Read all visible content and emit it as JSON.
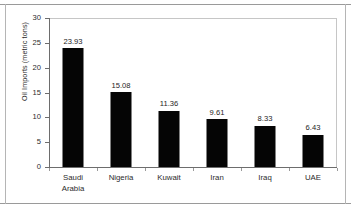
{
  "chart_data": {
    "type": "bar",
    "title": "",
    "subtitle": "",
    "xlabel": "",
    "ylabel": "Oil Imports (metric tons)",
    "categories": [
      "Saudi\nArabia",
      "Nigeria",
      "Kuwait",
      "Iran",
      "Iraq",
      "UAE"
    ],
    "categories_plain": [
      "Saudi Arabia",
      "Nigeria",
      "Kuwait",
      "Iran",
      "Iraq",
      "UAE"
    ],
    "values": [
      23.93,
      15.08,
      11.36,
      9.61,
      8.33,
      6.43
    ],
    "value_labels": [
      "23.93",
      "15.08",
      "11.36",
      "9.61",
      "8.33",
      "6.43"
    ],
    "ylim": [
      0,
      30
    ],
    "ytick_labels": [
      "30",
      "25",
      "20",
      "15",
      "10",
      "5",
      "0"
    ],
    "ytick_values": [
      30,
      25,
      20,
      15,
      10,
      5,
      0
    ],
    "grid": false,
    "legend": null,
    "legend_position": "none",
    "bar_color": "#050505",
    "plot_background": "#ffffff",
    "frame_color": "#c6c6c6",
    "axis_color": "#6d6d6d",
    "text_color": "#2b2b2b"
  }
}
